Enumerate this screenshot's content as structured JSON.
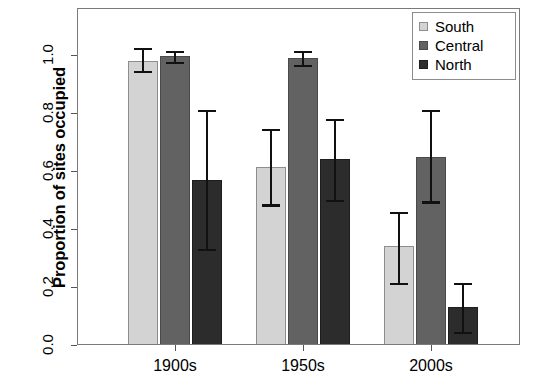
{
  "chart_data": {
    "type": "bar",
    "title": "",
    "xlabel": "",
    "ylabel": "Proportion of sites occupied",
    "categories": [
      "1900s",
      "1950s",
      "2000s"
    ],
    "ylim": [
      0.0,
      1.15
    ],
    "yticks": [
      "0.0",
      "0.2",
      "0.4",
      "0.6",
      "0.8",
      "1.0"
    ],
    "ytick_values": [
      0.0,
      0.2,
      0.4,
      0.6,
      0.8,
      1.0
    ],
    "grid": false,
    "legend_position": "top-right",
    "series": [
      {
        "name": "South",
        "color": "#d3d3d3",
        "values": [
          0.98,
          0.615,
          0.34
        ],
        "err_low": [
          0.945,
          0.485,
          0.215
        ],
        "err_high": [
          1.025,
          0.745,
          0.46
        ]
      },
      {
        "name": "Central",
        "color": "#626262",
        "values": [
          0.995,
          0.99,
          0.65
        ],
        "err_low": [
          0.975,
          0.965,
          0.495
        ],
        "err_high": [
          1.015,
          1.015,
          0.81
        ]
      },
      {
        "name": "North",
        "color": "#2c2c2c",
        "values": [
          0.57,
          0.64,
          0.13
        ],
        "err_low": [
          0.33,
          0.5,
          0.045
        ],
        "err_high": [
          0.81,
          0.78,
          0.215
        ]
      }
    ]
  },
  "legend": {
    "items": [
      {
        "label": "South",
        "color": "#d3d3d3"
      },
      {
        "label": "Central",
        "color": "#626262"
      },
      {
        "label": "North",
        "color": "#2c2c2c"
      }
    ]
  },
  "axes": {
    "y_title": "Proportion of sites occupied",
    "y_tick_labels": [
      "0.0",
      "0.2",
      "0.4",
      "0.6",
      "0.8",
      "1.0"
    ],
    "x_tick_labels": [
      "1900s",
      "1950s",
      "2000s"
    ]
  }
}
